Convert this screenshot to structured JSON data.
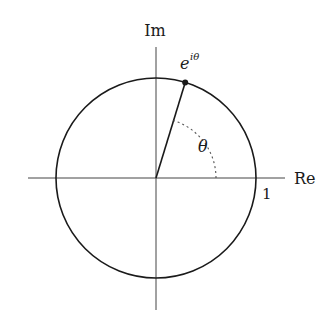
{
  "diagram": {
    "type": "unit-circle",
    "labels": {
      "imag_axis": "Im",
      "real_axis": "Re",
      "unit_tick": "1",
      "point_base": "e",
      "point_exp": "iθ",
      "angle": "θ"
    },
    "geometry": {
      "center": [
        156,
        178
      ],
      "radius": 100,
      "theta_degrees": 73,
      "angle_arc_radius": 60
    },
    "colors": {
      "stroke": "#1a1a1a",
      "axis": "#444444",
      "arc_dotted": "#555555",
      "background": "#ffffff"
    }
  }
}
